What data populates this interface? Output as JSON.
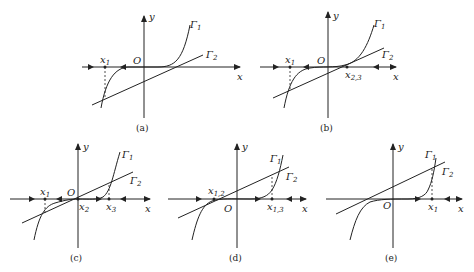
{
  "figure": {
    "stroke_color": "#222222",
    "background": "#ffffff",
    "axis_labels": {
      "x": "x",
      "y": "y",
      "origin": "O"
    },
    "curve_labels": {
      "gamma1": "Γ",
      "gamma1_sub": "1",
      "gamma2": "Γ",
      "gamma2_sub": "2"
    },
    "panels": [
      {
        "id": "a",
        "caption": "(a)",
        "points": [
          {
            "name": "x",
            "sub": "1"
          }
        ],
        "description": "Line Γ2 intersects cubic Γ1 once at x1 (left of origin); arrows on x-axis point toward x1."
      },
      {
        "id": "b",
        "caption": "(b)",
        "points": [
          {
            "name": "x",
            "sub": "1"
          },
          {
            "name": "x",
            "sub": "2,3"
          }
        ],
        "description": "Line Γ2 tangent to Γ1 at x2,3 and crosses at x1."
      },
      {
        "id": "c",
        "caption": "(c)",
        "points": [
          {
            "name": "x",
            "sub": "1"
          },
          {
            "name": "x",
            "sub": "2"
          },
          {
            "name": "x",
            "sub": "3"
          }
        ],
        "description": "Line Γ2 crosses Γ1 three times at x1, x2, x3."
      },
      {
        "id": "d",
        "caption": "(d)",
        "points": [
          {
            "name": "x",
            "sub": "1,2"
          },
          {
            "name": "x",
            "sub": "1,3"
          }
        ],
        "description": "Line Γ2 tangent to Γ1 at x1,2 and crosses at x1,3."
      },
      {
        "id": "e",
        "caption": "(e)",
        "points": [
          {
            "name": "x",
            "sub": "1"
          }
        ],
        "description": "Line Γ2 crosses Γ1 once at x1 (right of origin)."
      }
    ]
  }
}
